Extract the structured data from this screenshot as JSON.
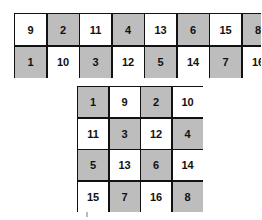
{
  "top_grid": {
    "rows": [
      [
        {
          "n": "9",
          "shaded": false
        },
        {
          "n": "2",
          "shaded": true
        },
        {
          "n": "11",
          "shaded": false
        },
        {
          "n": "4",
          "shaded": true
        },
        {
          "n": "13",
          "shaded": false
        },
        {
          "n": "6",
          "shaded": true
        },
        {
          "n": "15",
          "shaded": false
        },
        {
          "n": "8",
          "shaded": true
        }
      ],
      [
        {
          "n": "1",
          "shaded": true
        },
        {
          "n": "10",
          "shaded": false
        },
        {
          "n": "3",
          "shaded": true
        },
        {
          "n": "12",
          "shaded": false
        },
        {
          "n": "5",
          "shaded": true
        },
        {
          "n": "14",
          "shaded": false
        },
        {
          "n": "7",
          "shaded": true
        },
        {
          "n": "16",
          "shaded": false
        }
      ]
    ]
  },
  "bottom_grid": {
    "rows": [
      [
        {
          "n": "1",
          "shaded": true
        },
        {
          "n": "9",
          "shaded": false
        },
        {
          "n": "2",
          "shaded": true
        },
        {
          "n": "10",
          "shaded": false
        }
      ],
      [
        {
          "n": "11",
          "shaded": false
        },
        {
          "n": "3",
          "shaded": true
        },
        {
          "n": "12",
          "shaded": false
        },
        {
          "n": "4",
          "shaded": true
        }
      ],
      [
        {
          "n": "5",
          "shaded": true
        },
        {
          "n": "13",
          "shaded": false
        },
        {
          "n": "6",
          "shaded": true
        },
        {
          "n": "14",
          "shaded": false
        }
      ],
      [
        {
          "n": "15",
          "shaded": false
        },
        {
          "n": "7",
          "shaded": true
        },
        {
          "n": "16",
          "shaded": false
        },
        {
          "n": "8",
          "shaded": true
        }
      ]
    ]
  },
  "colors": {
    "shade": "#bdbdbd",
    "border": "#111111",
    "background": "#ffffff"
  }
}
